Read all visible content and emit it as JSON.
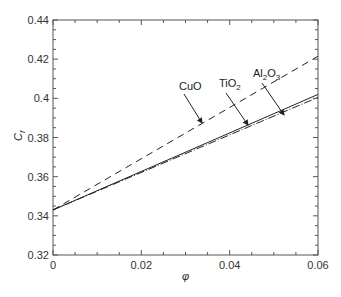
{
  "chart_data": {
    "type": "line",
    "title": "",
    "xlabel": "φ",
    "ylabel": "Cf",
    "xlim": [
      0,
      0.06
    ],
    "ylim": [
      0.32,
      0.44
    ],
    "xticks": [
      "0",
      "0.02",
      "0.04",
      "0.06"
    ],
    "yticks": [
      "0.32",
      "0.34",
      "0.36",
      "0.38",
      "0.4",
      "0.42",
      "0.44"
    ],
    "grid": false,
    "series": [
      {
        "name": "CuO",
        "style": "dashed",
        "x": [
          0,
          0.06
        ],
        "y": [
          0.343,
          0.4215
        ]
      },
      {
        "name": "TiO2",
        "style": "solid",
        "x": [
          0,
          0.06
        ],
        "y": [
          0.343,
          0.402
        ]
      },
      {
        "name": "Al2O3",
        "style": "dash-dot",
        "x": [
          0,
          0.06
        ],
        "y": [
          0.343,
          0.4005
        ]
      }
    ],
    "annotations": [
      {
        "text": "CuO",
        "points_to": "CuO"
      },
      {
        "text": "TiO2",
        "points_to": "TiO2"
      },
      {
        "text": "Al2O3",
        "points_to": "Al2O3"
      }
    ]
  },
  "labels": {
    "cuo": "CuO",
    "tio2_main": "TiO",
    "tio2_sub": "2",
    "al_main": "Al",
    "al_sub1": "2",
    "al_mid": "O",
    "al_sub2": "3",
    "ylabel_main": "C",
    "ylabel_sub": "f",
    "xlabel": "φ"
  }
}
